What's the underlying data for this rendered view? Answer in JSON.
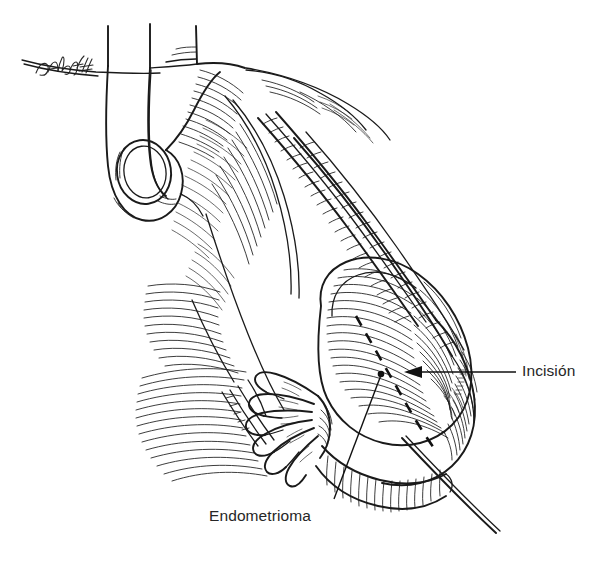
{
  "figure": {
    "background_color": "#ffffff",
    "ink_color": "#1a1a1a",
    "text_color": "#262626",
    "artist_signature": "DAbdoff",
    "style": "pen-and-ink line drawing with cross-hatching"
  },
  "labels": {
    "incision": {
      "text": "Incisión",
      "leader_type": "arrow",
      "x": 522,
      "y": 363
    },
    "endometrioma": {
      "text": "Endometrioma",
      "leader_type": "dot",
      "x": 209,
      "y": 508
    }
  },
  "annotations": {
    "incision_dashed_line": "dashed surgical incision line over the cyst surface",
    "incision_arrow": "arrow pointing left toward the dashed incision line",
    "endometrioma_leader_dot": "leader line ending in a filled dot on the cyst"
  },
  "anatomy": [
    {
      "name": "uterine-fundus",
      "description": "uterine body at upper left"
    },
    {
      "name": "fallopian-tube-loop",
      "description": "looped fallopian tube with oval opening"
    },
    {
      "name": "broad-ligament",
      "description": "hatched broad ligament sheet"
    },
    {
      "name": "fimbriae",
      "description": "finger-like fimbrial projections"
    },
    {
      "name": "ovarian-endometrioma",
      "description": "large ovoid cystic mass at right"
    },
    {
      "name": "suture-thread",
      "description": "thread extending to lower right"
    }
  ]
}
